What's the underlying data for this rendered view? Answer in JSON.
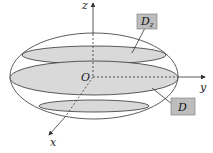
{
  "diagram": {
    "axes": {
      "x_label": "x",
      "y_label": "y",
      "z_label": "z",
      "origin_label": "O"
    },
    "callouts": {
      "upper_section": {
        "label": "D",
        "subscript": "z"
      },
      "middle_section": {
        "label": "D",
        "subscript": ""
      }
    },
    "colors": {
      "section_fill": "#d9d9d9",
      "callout_fill": "#bdbdbd",
      "stroke": "#333333"
    }
  }
}
